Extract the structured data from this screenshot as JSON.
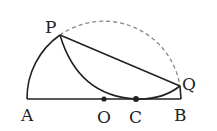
{
  "diagram": {
    "labels": {
      "P": "P",
      "Q": "Q",
      "A": "A",
      "O": "O",
      "C": "C",
      "B": "B"
    },
    "points": {
      "A": [
        27,
        99
      ],
      "B": [
        181,
        99
      ],
      "O": [
        104,
        99
      ],
      "C": [
        136,
        99
      ],
      "P": [
        60,
        35
      ],
      "Q": [
        180,
        86
      ]
    },
    "colors": {
      "stroke": "#222222",
      "dashed": "#888888"
    }
  }
}
